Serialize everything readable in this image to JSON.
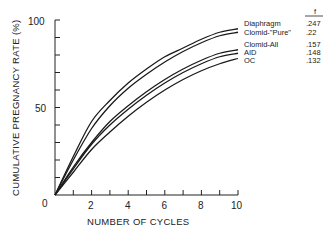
{
  "chart_data": {
    "type": "line",
    "title": "",
    "xlabel": "NUMBER OF CYCLES",
    "ylabel": "CUMULATIVE PREGNANCY RATE (%)",
    "xlim": [
      0,
      10
    ],
    "ylim": [
      0,
      100
    ],
    "x_ticks": [
      "0",
      "2",
      "4",
      "6",
      "8",
      "10"
    ],
    "y_ticks": [
      "0",
      "50",
      "100"
    ],
    "grid": false,
    "legend_position": "right-inline",
    "legend_header": "f",
    "x": [
      0,
      1,
      2,
      3,
      4,
      5,
      6,
      7,
      8,
      9,
      10
    ],
    "series": [
      {
        "name": "Diaphragm",
        "f": ".247",
        "values": [
          0,
          22,
          42,
          54,
          64,
          72,
          79,
          84,
          89,
          93,
          95
        ]
      },
      {
        "name": "Clomid-\"Pure\"",
        "f": ".22",
        "values": [
          0,
          20,
          38,
          51,
          61,
          69,
          76,
          82,
          87,
          91,
          93
        ]
      },
      {
        "name": "Clomid-All",
        "f": ".157",
        "values": [
          0,
          16,
          30,
          42,
          51,
          59,
          66,
          72,
          77,
          81,
          83
        ]
      },
      {
        "name": "AID",
        "f": ".148",
        "values": [
          0,
          15,
          29,
          40,
          49,
          57,
          64,
          70,
          75,
          79,
          81
        ]
      },
      {
        "name": "OC",
        "f": ".132",
        "values": [
          0,
          13,
          26,
          36,
          45,
          53,
          60,
          66,
          71,
          75,
          78
        ]
      }
    ]
  },
  "axes": {
    "y_title": "CUMULATIVE PREGNANCY RATE (%)",
    "x_title": "NUMBER OF CYCLES",
    "y_tick_0": "0",
    "y_tick_50": "50",
    "y_tick_100": "100",
    "x_tick_2": "2",
    "x_tick_4": "4",
    "x_tick_6": "6",
    "x_tick_8": "8",
    "x_tick_10": "10"
  },
  "legend": {
    "header": "f",
    "items": [
      {
        "label": "Diaphragm",
        "value": ".247"
      },
      {
        "label": "Clomid-\"Pure\"",
        "value": ".22"
      },
      {
        "label": "Clomid-All",
        "value": ".157"
      },
      {
        "label": "AID",
        "value": ".148"
      },
      {
        "label": "OC",
        "value": ".132"
      }
    ]
  }
}
